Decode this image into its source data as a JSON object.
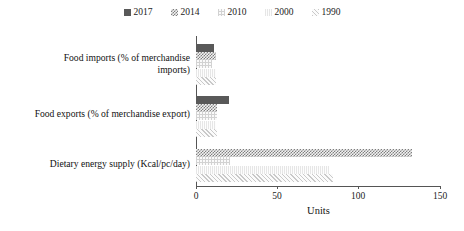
{
  "chart_data": {
    "type": "bar",
    "orientation": "horizontal",
    "title": "",
    "xlabel": "Units",
    "ylabel": "",
    "xlim": [
      0,
      150
    ],
    "xticks": [
      0,
      50,
      100,
      150
    ],
    "grid": false,
    "legend_position": "top",
    "categories": [
      "Food imports (% of merchandise imports)",
      "Food exports (% of merchandise export)",
      "Dietary energy supply (Kcal/pc/day)"
    ],
    "series": [
      {
        "name": "2017",
        "values": [
          11,
          20,
          0
        ]
      },
      {
        "name": "2014",
        "values": [
          12,
          13,
          133
        ]
      },
      {
        "name": "2010",
        "values": [
          10,
          13,
          21
        ]
      },
      {
        "name": "2000",
        "values": [
          12,
          12,
          82
        ]
      },
      {
        "name": "1990",
        "values": [
          12,
          13,
          84
        ]
      }
    ]
  },
  "legend": {
    "items": [
      {
        "label": "2017",
        "pattern": "solid-dark",
        "color": "#595959"
      },
      {
        "label": "2014",
        "pattern": "checker",
        "color": "#7f7f7f"
      },
      {
        "label": "2010",
        "pattern": "grid-light",
        "color": "#d2d2d2"
      },
      {
        "label": "2000",
        "pattern": "dots-faint",
        "color": "#e6e6e6"
      },
      {
        "label": "1990",
        "pattern": "diagonal-hatch",
        "color": "#c9c9c9"
      }
    ]
  },
  "axis": {
    "x_title": "Units",
    "tick_labels": [
      "0",
      "50",
      "100",
      "150"
    ]
  }
}
